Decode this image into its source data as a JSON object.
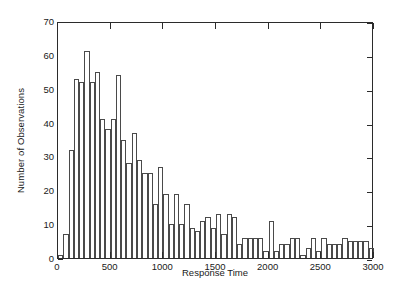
{
  "chart_data": {
    "type": "bar",
    "title": "",
    "subtitle": "",
    "xlabel": "Response Time",
    "ylabel": "Number of Observations",
    "xlim": [
      0,
      3000
    ],
    "ylim": [
      0,
      70
    ],
    "bin_width": 50,
    "grid": false,
    "legend": null,
    "x_ticks": [
      0,
      500,
      1000,
      1500,
      2000,
      2500,
      3000
    ],
    "x_tick_labels": [
      "0",
      "500",
      "1000",
      "1500",
      "2000",
      "2500",
      "3000"
    ],
    "y_ticks": [
      0,
      10,
      20,
      30,
      40,
      50,
      60,
      70
    ],
    "y_tick_labels": [
      "0",
      "10",
      "20",
      "30",
      "40",
      "50",
      "60",
      "70"
    ],
    "bin_starts": [
      0,
      50,
      100,
      150,
      200,
      250,
      300,
      350,
      400,
      450,
      500,
      550,
      600,
      650,
      700,
      750,
      800,
      850,
      900,
      950,
      1000,
      1050,
      1100,
      1150,
      1200,
      1250,
      1300,
      1350,
      1400,
      1450,
      1500,
      1550,
      1600,
      1650,
      1700,
      1750,
      1800,
      1850,
      1900,
      1950,
      2000,
      2050,
      2100,
      2150,
      2200,
      2250,
      2300,
      2350,
      2400,
      2450,
      2500,
      2550,
      2600,
      2650,
      2700,
      2750,
      2800,
      2850,
      2900,
      2950
    ],
    "values": [
      1,
      7,
      32,
      53,
      52,
      61,
      52,
      55,
      41,
      38,
      41,
      54,
      35,
      28,
      37,
      29,
      25,
      25,
      16,
      27,
      19,
      10,
      19,
      10,
      16,
      9,
      8,
      11,
      12,
      9,
      13,
      7,
      13,
      12,
      4,
      6,
      6,
      6,
      6,
      2,
      11,
      2,
      4,
      4,
      6,
      6,
      1,
      3,
      6,
      2,
      6,
      4,
      4,
      4,
      6,
      5,
      5,
      5,
      5,
      3
    ],
    "colors": {
      "bar_edge": "#4a4a4a",
      "bar_fill": "#ffffff",
      "axis": "#2b2b2b",
      "text": "#1a1a1a",
      "background": "#ffffff"
    }
  }
}
